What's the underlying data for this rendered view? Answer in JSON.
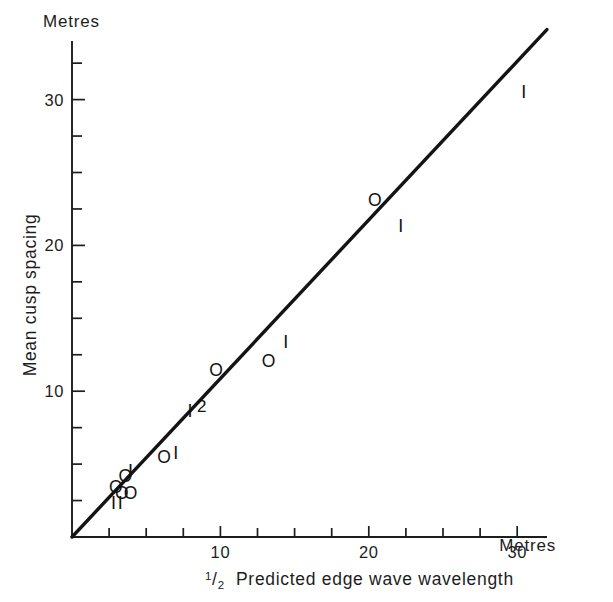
{
  "chart_data": {
    "type": "scatter",
    "title": "",
    "xlabel": "½ Predicted edge wave wavelength",
    "ylabel": "Mean cusp spacing",
    "x_unit_label": "Metres",
    "y_unit_label": "Metres",
    "xlim": [
      0,
      32
    ],
    "ylim": [
      0,
      34
    ],
    "grid": false,
    "legend": false,
    "x_ticks_labeled": [
      10,
      20,
      30
    ],
    "y_ticks_labeled": [
      10,
      20,
      30
    ],
    "x_tick_labels": [
      "10",
      "20",
      "30"
    ],
    "y_tick_labels": [
      "10",
      "20",
      "30"
    ],
    "x_minor_tick_step": 2.5,
    "y_minor_tick_step": 2.5,
    "reference_line": {
      "label": "1:1 line",
      "from": [
        0,
        0
      ],
      "to": [
        32,
        34.8
      ]
    },
    "marker_glyphs": {
      "o": "O",
      "i": "I",
      "two": "2"
    },
    "points": [
      {
        "glyph": "I",
        "x": 2.8,
        "y": 2.3
      },
      {
        "glyph": "I",
        "x": 3.25,
        "y": 2.3
      },
      {
        "glyph": "O",
        "x": 2.95,
        "y": 3.45
      },
      {
        "glyph": "O",
        "x": 3.35,
        "y": 3.05
      },
      {
        "glyph": "O",
        "x": 3.95,
        "y": 3.05
      },
      {
        "glyph": "O",
        "x": 3.6,
        "y": 4.2
      },
      {
        "glyph": "I",
        "x": 3.95,
        "y": 4.55
      },
      {
        "glyph": "O",
        "x": 6.2,
        "y": 5.5
      },
      {
        "glyph": "I",
        "x": 7.0,
        "y": 5.75
      },
      {
        "glyph": "I",
        "x": 7.95,
        "y": 8.65
      },
      {
        "glyph": "2",
        "x": 8.75,
        "y": 9.0
      },
      {
        "glyph": "O",
        "x": 9.7,
        "y": 11.45
      },
      {
        "glyph": "O",
        "x": 13.25,
        "y": 12.1
      },
      {
        "glyph": "I",
        "x": 14.4,
        "y": 13.4
      },
      {
        "glyph": "O",
        "x": 20.4,
        "y": 23.1
      },
      {
        "glyph": "I",
        "x": 22.15,
        "y": 21.3
      },
      {
        "glyph": "I",
        "x": 30.45,
        "y": 30.5
      }
    ]
  },
  "axes": {
    "x_axis_name": "x-axis",
    "y_axis_name": "y-axis",
    "x_title_fraction_numerator": "1",
    "x_title_fraction_denominator": "2",
    "x_title_text": "Predicted edge wave wavelength",
    "y_title_text": "Mean cusp spacing"
  }
}
